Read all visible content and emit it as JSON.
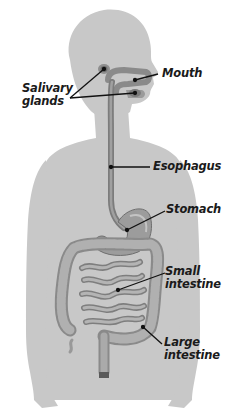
{
  "diagram": {
    "colors": {
      "body_silhouette": "#c8c8c8",
      "organ_fill": "#a9a9a9",
      "organ_dark": "#6e6e6e",
      "leader_line": "#111111",
      "label_text": "#1a1a1a",
      "background": "#ffffff"
    },
    "labels": {
      "mouth": "Mouth",
      "salivary_glands": {
        "line1": "Salivary",
        "line2": "glands"
      },
      "esophagus": "Esophagus",
      "stomach": "Stomach",
      "small_intestine": {
        "line1": "Small",
        "line2": "intestine"
      },
      "large_intestine": {
        "line1": "Large",
        "line2": "intestine"
      }
    }
  }
}
